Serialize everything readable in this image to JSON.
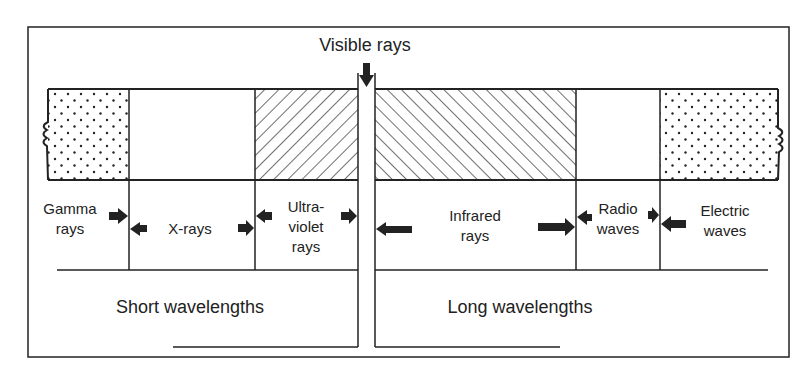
{
  "diagram": {
    "title": "Visible rays",
    "bands": [
      {
        "name": "gamma-rays",
        "label_line1": "Gamma",
        "label_line2": "rays",
        "pattern": "dots"
      },
      {
        "name": "x-rays",
        "label_line1": "X-rays",
        "pattern": "blank"
      },
      {
        "name": "ultraviolet-rays",
        "label_line1": "Ultra-",
        "label_line2": "violet",
        "label_line3": "rays",
        "pattern": "hatch-forward"
      },
      {
        "name": "infrared-rays",
        "label_line1": "Infrared",
        "label_line2": "rays",
        "pattern": "hatch-back"
      },
      {
        "name": "radio-waves",
        "label_line1": "Radio",
        "label_line2": "waves",
        "pattern": "blank"
      },
      {
        "name": "electric-waves",
        "label_line1": "Electric",
        "label_line2": "waves",
        "pattern": "dots"
      }
    ],
    "short_label": "Short wavelengths",
    "long_label": "Long wavelengths",
    "colors": {
      "line": "#222222",
      "background": "#ffffff"
    }
  }
}
